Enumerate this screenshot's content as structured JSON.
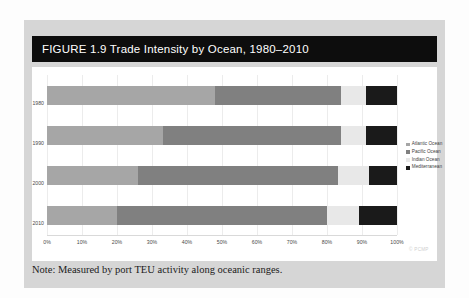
{
  "figure": {
    "label": "FIGURE 1.9",
    "title": "Trade Intensity by Ocean, 1980–2010",
    "title_full": "FIGURE 1.9  Trade Intensity by Ocean, 1980–2010",
    "note": "Note: Measured by port TEU activity along oceanic ranges.",
    "watermark": "© PCMP"
  },
  "colors": {
    "banner_bg": "#0d0d0d",
    "banner_text": "#ffffff",
    "panel_bg": "#d6d6d6",
    "plot_bg": "#ffffff",
    "gridline": "#ececec",
    "atlantic": "#a6a6a6",
    "pacific": "#808080",
    "indian": "#e8e8e8",
    "mediterranean": "#1a1a1a"
  },
  "legend": {
    "position": "right",
    "items": [
      {
        "label": "Atlantic Ocean",
        "color": "#a6a6a6"
      },
      {
        "label": "Pacific Ocean",
        "color": "#808080"
      },
      {
        "label": "Indian Ocean",
        "color": "#e8e8e8"
      },
      {
        "label": "Mediterranean",
        "color": "#1a1a1a"
      }
    ]
  },
  "chart_data": {
    "type": "bar",
    "orientation": "horizontal",
    "stacked": true,
    "normalized": true,
    "title": "Trade Intensity by Ocean, 1980–2010",
    "xlabel": "",
    "ylabel": "",
    "xlim": [
      0,
      100
    ],
    "xtick_labels": [
      "0%",
      "10%",
      "20%",
      "30%",
      "40%",
      "50%",
      "60%",
      "70%",
      "80%",
      "90%",
      "100%"
    ],
    "xticks": [
      0,
      10,
      20,
      30,
      40,
      50,
      60,
      70,
      80,
      90,
      100
    ],
    "grid": true,
    "categories": [
      "1980",
      "1990",
      "2000",
      "2010"
    ],
    "series": [
      {
        "name": "Atlantic Ocean",
        "color": "#a6a6a6",
        "values": [
          48,
          33,
          26,
          20
        ]
      },
      {
        "name": "Pacific Ocean",
        "color": "#808080",
        "values": [
          36,
          51,
          57,
          60
        ]
      },
      {
        "name": "Indian Ocean",
        "color": "#e8e8e8",
        "values": [
          7,
          7,
          9,
          9
        ]
      },
      {
        "name": "Mediterranean",
        "color": "#1a1a1a",
        "values": [
          9,
          9,
          8,
          11
        ]
      }
    ]
  }
}
